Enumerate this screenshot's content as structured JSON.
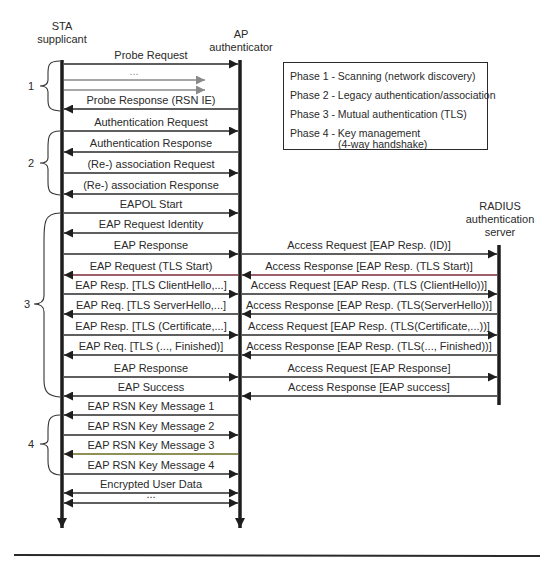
{
  "entities": {
    "sta": {
      "line1": "STA",
      "line2": "supplicant"
    },
    "ap": {
      "line1": "AP",
      "line2": "authenticator"
    },
    "radius": {
      "line1": "RADIUS",
      "line2": "authentication",
      "line3": "server"
    }
  },
  "legend": {
    "phase1": "Phase 1 - Scanning (network discovery)",
    "phase2": "Phase 2 - Legacy authentication/association",
    "phase3": "Phase 3 - Mutual authentication (TLS)",
    "phase4_line1": "Phase 4 - Key management",
    "phase4_line2": "(4-way handshake)"
  },
  "phases": [
    "1",
    "2",
    "3",
    "4"
  ],
  "sta_ap_messages": [
    {
      "label": "Probe Request",
      "y": 64,
      "dir": "right"
    },
    {
      "label": "...",
      "y": 80,
      "dir": "right",
      "gray": true
    },
    {
      "label": "",
      "y": 90,
      "dir": "right",
      "gray": true
    },
    {
      "label": "Probe Response (RSN IE)",
      "y": 109,
      "dir": "left"
    },
    {
      "label": "Authentication Request",
      "y": 131,
      "dir": "right"
    },
    {
      "label": "Authentication Response",
      "y": 152,
      "dir": "left"
    },
    {
      "label": "(Re-) association Request",
      "y": 173,
      "dir": "right"
    },
    {
      "label": "(Re-) association Response",
      "y": 194,
      "dir": "left"
    },
    {
      "label": "EAPOL Start",
      "y": 213,
      "dir": "right"
    },
    {
      "label": "EAP Request Identity",
      "y": 233,
      "dir": "left"
    },
    {
      "label": "EAP Response",
      "y": 254,
      "dir": "right"
    },
    {
      "label": "EAP Request (TLS Start)",
      "y": 275,
      "dir": "left"
    },
    {
      "label": "EAP Resp. [TLS ClientHello,...]",
      "y": 294,
      "dir": "right"
    },
    {
      "label": "EAP Req. [TLS ServerHello,...]",
      "y": 314,
      "dir": "left"
    },
    {
      "label": "EAP Resp. [TLS (Certificate,...]",
      "y": 335,
      "dir": "right"
    },
    {
      "label": "EAP Req. [TLS (..., Finished)]",
      "y": 355,
      "dir": "left"
    },
    {
      "label": "EAP Response",
      "y": 377,
      "dir": "right"
    },
    {
      "label": "EAP Success",
      "y": 396,
      "dir": "left"
    },
    {
      "label": "EAP RSN Key Message 1",
      "y": 415,
      "dir": "left"
    },
    {
      "label": "EAP RSN Key Message 2",
      "y": 435,
      "dir": "right"
    },
    {
      "label": "EAP RSN Key Message 3",
      "y": 454,
      "dir": "left"
    },
    {
      "label": "EAP RSN Key Message 4",
      "y": 474,
      "dir": "right"
    },
    {
      "label": "Encrypted User Data",
      "y": 493,
      "dir": "both"
    },
    {
      "label": "...",
      "y": 503,
      "dir": "both"
    }
  ],
  "ap_radius_messages": [
    {
      "label": "Access Request [EAP Resp. (ID)]",
      "y": 254,
      "dir": "right"
    },
    {
      "label": "Access Response [EAP Resp. (TLS Start)]",
      "y": 275,
      "dir": "left"
    },
    {
      "label": "Access Request [EAP Resp. (TLS (ClientHello))]",
      "y": 294,
      "dir": "right"
    },
    {
      "label": "Access Response [EAP Resp. (TLS(ServerHello))]",
      "y": 314,
      "dir": "left"
    },
    {
      "label": "Access Request [EAP Resp. (TLS(Certificate,...))]",
      "y": 335,
      "dir": "right"
    },
    {
      "label": "Access Response [EAP Resp. (TLS(..., Finished))]",
      "y": 355,
      "dir": "left"
    },
    {
      "label": "Access Request [EAP Response]",
      "y": 377,
      "dir": "right"
    },
    {
      "label": "Access Response [EAP success]",
      "y": 396,
      "dir": "left"
    }
  ]
}
